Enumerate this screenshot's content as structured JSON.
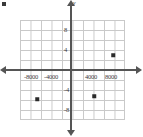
{
  "figure": {
    "corner_mark": "corner-mark",
    "y_axis_title": "y"
  },
  "chart_data": {
    "type": "scatter",
    "title": "",
    "xlabel": "",
    "ylabel": "y",
    "xlim": [
      -10500,
      10500
    ],
    "ylim": [
      -10,
      10
    ],
    "grid": true,
    "legend": "none",
    "x_tick_labels": [
      "-8000",
      "-4000",
      "4000",
      "8000"
    ],
    "x_tick_values": [
      -8000,
      -4000,
      4000,
      8000
    ],
    "y_tick_labels": [
      "8",
      "4",
      "-4",
      "-8"
    ],
    "y_tick_values": [
      8,
      4,
      -4,
      -8
    ],
    "points": [
      {
        "x": 8400,
        "y": 3.0
      },
      {
        "x": 4600,
        "y": -5.2
      },
      {
        "x": -6800,
        "y": -5.8
      }
    ]
  }
}
